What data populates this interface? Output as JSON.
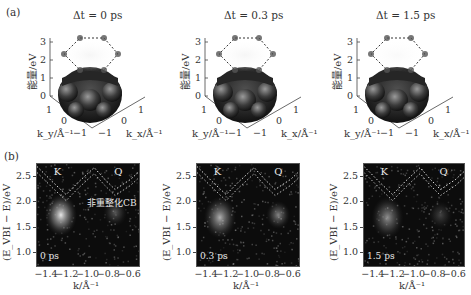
{
  "panel_a": {
    "letter": "(a)",
    "panels": [
      {
        "title": "Δt = 0 ps",
        "zlabel": "能量/eV",
        "ky_label": "k_y/Å⁻¹",
        "kx_label": "k_x/Å⁻¹"
      },
      {
        "title": "Δt = 0.3 ps",
        "zlabel": "能量/eV",
        "ky_label": "k_y/Å⁻¹",
        "kx_label": "k_x/Å⁻¹"
      },
      {
        "title": "Δt = 1.5 ps",
        "zlabel": "能量/eV",
        "ky_label": "k_y/Å⁻¹",
        "kx_label": "k_x/Å⁻¹"
      }
    ],
    "zticks": [
      "0",
      "1",
      "2",
      "3"
    ],
    "kticks": [
      "1",
      "0",
      "−1"
    ]
  },
  "panel_b": {
    "letter": "(b)",
    "ylabel": "(E_VBI − E)/eV",
    "xlabel": "k/Å⁻¹",
    "yticks": [
      "2.5",
      "2.0",
      "1.5",
      "1.0"
    ],
    "xticks": [
      "−1.4",
      "−1.2",
      "−1.0",
      "−0.8",
      "−0.6"
    ],
    "valley_labels": {
      "k": "K",
      "q": "Q"
    },
    "cb_annotation": "非重整化CB",
    "delays": [
      "0 ps",
      "0.3 ps",
      "1.5 ps"
    ]
  },
  "chart_data": [
    {
      "type": "surface3d",
      "title": "Δt = 0 ps",
      "zlabel": "能量/eV",
      "xlabel": "k_x/Å⁻¹",
      "ylabel": "k_y/Å⁻¹",
      "zlim": [
        0,
        3
      ],
      "xlim": [
        -1,
        1
      ],
      "ylim": [
        -1,
        1
      ],
      "description": "Valence band surface (0–1 eV) with excited CB population at 2–3 eV on hexagonal BZ edge (dashed hexagon)"
    },
    {
      "type": "surface3d",
      "title": "Δt = 0.3 ps",
      "zlabel": "能量/eV",
      "xlabel": "k_x/Å⁻¹",
      "ylabel": "k_y/Å⁻¹",
      "zlim": [
        0,
        3
      ],
      "xlim": [
        -1,
        1
      ],
      "ylim": [
        -1,
        1
      ]
    },
    {
      "type": "surface3d",
      "title": "Δt = 1.5 ps",
      "zlabel": "能量/eV",
      "xlabel": "k_x/Å⁻¹",
      "ylabel": "k_y/Å⁻¹",
      "zlim": [
        0,
        3
      ],
      "xlim": [
        -1,
        1
      ],
      "ylim": [
        -1,
        1
      ]
    },
    {
      "type": "heatmap",
      "title": "0 ps",
      "xlabel": "k/Å⁻¹",
      "ylabel": "(E_VBI − E)/eV",
      "xlim": [
        -1.5,
        -0.52
      ],
      "ylim": [
        0.75,
        2.75
      ],
      "xticks": [
        -1.4,
        -1.2,
        -1.0,
        -0.8,
        -0.6
      ],
      "yticks": [
        1.0,
        1.5,
        2.0,
        2.5
      ],
      "hotspots": [
        {
          "valley": "K",
          "k": -1.27,
          "E": 1.75,
          "intensity": 1.0
        },
        {
          "valley": "Q",
          "k": -0.75,
          "E": 1.8,
          "intensity": 0.35
        }
      ],
      "dashed_cb": {
        "k": [
          -1.5,
          -1.35,
          -1.22,
          -1.1,
          -0.95,
          -0.85,
          -0.75,
          -0.6,
          -0.52
        ],
        "E": [
          2.7,
          2.4,
          2.15,
          2.4,
          2.68,
          2.45,
          2.25,
          2.45,
          2.6
        ]
      },
      "annotations": [
        "K",
        "Q",
        "非重整化CB"
      ]
    },
    {
      "type": "heatmap",
      "title": "0.3 ps",
      "xlabel": "k/Å⁻¹",
      "ylabel": "(E_VBI − E)/eV",
      "xlim": [
        -1.5,
        -0.52
      ],
      "ylim": [
        0.75,
        2.75
      ],
      "hotspots": [
        {
          "valley": "K",
          "k": -1.28,
          "E": 1.7,
          "intensity": 0.75
        },
        {
          "valley": "Q",
          "k": -0.72,
          "E": 1.75,
          "intensity": 0.55
        }
      ],
      "annotations": [
        "K",
        "Q"
      ]
    },
    {
      "type": "heatmap",
      "title": "1.5 ps",
      "xlabel": "k/Å⁻¹",
      "ylabel": "(E_VBI − E)/eV",
      "xlim": [
        -1.5,
        -0.52
      ],
      "ylim": [
        0.75,
        2.75
      ],
      "hotspots": [
        {
          "valley": "K",
          "k": -1.27,
          "E": 1.7,
          "intensity": 0.6
        },
        {
          "valley": "Q",
          "k": -0.75,
          "E": 1.75,
          "intensity": 0.25
        }
      ],
      "annotations": [
        "K",
        "Q"
      ]
    }
  ]
}
